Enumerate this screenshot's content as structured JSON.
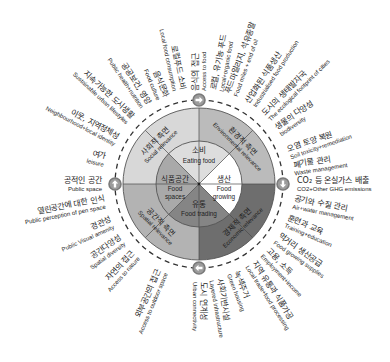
{
  "diagram": {
    "core": {
      "eating": {
        "ko": "소비",
        "en": "Eating food"
      },
      "growing": {
        "ko": "생산",
        "en_1": "Food",
        "en_2": "growing"
      },
      "trading": {
        "ko": "유통",
        "en": "Food trading"
      },
      "spaces": {
        "ko": "식품공간",
        "en_1": "Food",
        "en_2": "spaces"
      }
    },
    "relevance": {
      "social": {
        "ko": "사회적 측면",
        "en": "Social relevance"
      },
      "environmental": {
        "ko": "환경적 측면",
        "en": "Environmental relevance"
      },
      "economic": {
        "ko": "경제적 측면",
        "en": "Economic relevance"
      },
      "spatial": {
        "ko": "공간적 측면",
        "en": "Spatial relevance"
      }
    },
    "flow_arrows": [
      "right-arrow",
      "down-arrow",
      "left-arrow",
      "up-arrow"
    ],
    "labels": [
      {
        "ko": "음식의 접근",
        "en": "Access to food"
      },
      {
        "ko": "로컬, 유기농 푸드",
        "en": "Local+organic food"
      },
      {
        "ko": "푸드마일리지, 석유종말",
        "en": "Food miles + end of oil"
      },
      {
        "ko": "산업화된 식품생산",
        "en": "Industrialised food production"
      },
      {
        "ko": "도시의 생태발자국",
        "en": "The ecological footprint of cities"
      },
      {
        "ko": "생물의 다양성",
        "en": "biodiversity"
      },
      {
        "ko": "오염 토양 복원",
        "en": "Soil toxicity+remediation"
      },
      {
        "ko": "폐기물 관리",
        "en": "Waste management"
      },
      {
        "ko": "CO₂ 등 온실가스 배출",
        "en": "CO2+Other GHG emissions"
      },
      {
        "ko": "공기와 수질 관리",
        "en": "Air+water management"
      },
      {
        "ko": "훈련과 교육",
        "en": "Training+education"
      },
      {
        "ko": "먹거리 생산공급",
        "en": "Food growing supplies"
      },
      {
        "ko": "고용, 소득",
        "en": "Employment+income"
      },
      {
        "ko": "지역 유통과 식품가공",
        "en": "Local trade+food processing"
      },
      {
        "ko": "녹색주거",
        "en": "Green housing"
      },
      {
        "ko": "사회기반시설",
        "en": "Layered infrastructure"
      },
      {
        "ko": "도시 연계성",
        "en": "Urban connectivity"
      },
      {
        "ko": "외부공간의 접근",
        "en": "Access to outdoor space"
      },
      {
        "ko": "자연의 접근",
        "en": "Access to nature"
      },
      {
        "ko": "공간다양성",
        "en": "Spatial diversity"
      },
      {
        "ko": "경관성",
        "en": "Public Visual amenity"
      },
      {
        "ko": "열린공간에 대한 인식",
        "en": "Public perception of pen space"
      },
      {
        "ko": "공적인 공간",
        "en": "Public space"
      },
      {
        "ko": "여가",
        "en": "leisure"
      },
      {
        "ko": "이웃, 지역정체성",
        "en": "Neighbourhood+local identity"
      },
      {
        "ko": "지속가능한 도시생활",
        "en": "Sustainable urban lifestyles"
      },
      {
        "ko": "공공보건, 영양",
        "en": "Public health+nutrition"
      },
      {
        "ko": "음식문화",
        "en": "Food culture"
      },
      {
        "ko": "로컬푸드 소비",
        "en": "Local food consumption"
      }
    ]
  },
  "colors": {
    "social": "#d8d8d8",
    "environmental": "#bbbbbb",
    "economic": "#6e6e6e",
    "spatial": "#b3b3b3",
    "eating": "#dddddd",
    "growing": "#ffffff",
    "trading": "#858585",
    "spaces": "#a9a9a9",
    "lines": "#4a4a4a",
    "dashed_circle": "#333333",
    "marker": "#9c9c9c"
  }
}
